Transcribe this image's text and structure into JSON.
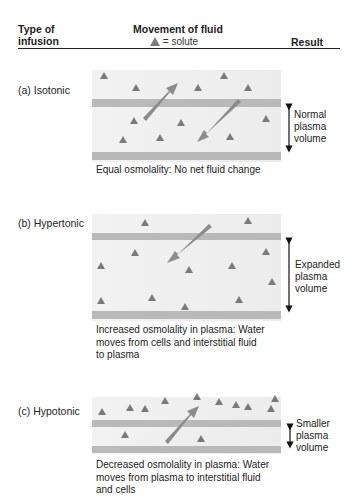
{
  "header": {
    "col1_line1": "Type of",
    "col1_line2": "infusion",
    "col2_title": "Movement of fluid",
    "col2_legend": "= solute",
    "col3": "Result"
  },
  "legend": {
    "solute_icon": "triangle-icon",
    "solute_color": "#7d7d7d"
  },
  "colors": {
    "band": "#b8b8b8",
    "background": "#efefef",
    "triangle": "#7a7a7a",
    "arrow": "#8c8c8c"
  },
  "panels": [
    {
      "id": "a",
      "label": "(a) Isotonic",
      "result_lines": [
        "Normal",
        "plasma",
        "volume"
      ],
      "caption_lines": [
        "Equal osmolality: No net fluid change"
      ],
      "arrows": [
        "into-cells-upward",
        "into-plasma-downward"
      ]
    },
    {
      "id": "b",
      "label": "(b) Hypertonic",
      "result_lines": [
        "Expanded",
        "plasma",
        "volume"
      ],
      "caption_lines": [
        "Increased osmolality in plasma: Water",
        "moves from cells and interstitial fluid",
        "to plasma"
      ],
      "arrows": [
        "into-plasma-downward"
      ]
    },
    {
      "id": "c",
      "label": "(c) Hypotonic",
      "result_lines": [
        "Smaller",
        "plasma",
        "volume"
      ],
      "caption_lines": [
        "Decreased osmolality in plasma: Water",
        "moves from plasma to interstitial fluid",
        "and cells"
      ],
      "arrows": [
        "out-of-plasma-upward"
      ]
    }
  ]
}
